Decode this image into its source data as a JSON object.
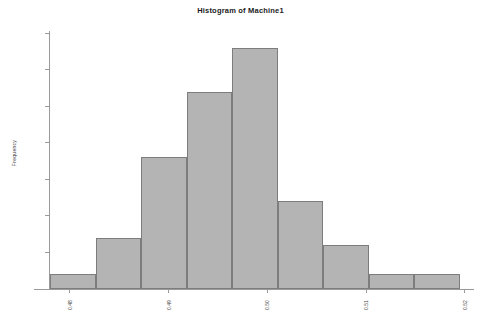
{
  "chart_data": {
    "type": "bar",
    "title": "Histogram of Machine1",
    "xlabel": "",
    "ylabel": "Frequency",
    "categories": [
      "0.4805",
      "0.4850",
      "0.4895",
      "0.4940",
      "0.4985",
      "0.5030",
      "0.5075",
      "0.5120",
      "0.5165"
    ],
    "values": [
      2,
      7,
      18,
      27,
      33,
      12,
      6,
      2,
      2
    ],
    "bar_order": [
      2,
      7,
      18,
      27,
      33,
      12,
      6,
      2
    ],
    "bars": [
      {
        "label": "bin-1",
        "value": 2
      },
      {
        "label": "bin-2",
        "value": 7
      },
      {
        "label": "bin-3",
        "value": 18
      },
      {
        "label": "bin-4",
        "value": 27
      },
      {
        "label": "bin-5",
        "value": 33
      },
      {
        "label": "bin-6",
        "value": 12
      },
      {
        "label": "bin-7",
        "value": 6
      },
      {
        "label": "bin-8",
        "value": 2
      }
    ],
    "ylim": [
      0,
      35
    ],
    "ytick_values": [
      0,
      5,
      10,
      15,
      20,
      25,
      30,
      35
    ],
    "ytick_labels": [
      "0",
      "5",
      "10",
      "15",
      "20",
      "25",
      "30",
      "35"
    ],
    "xlim": [
      0.478,
      0.5195
    ],
    "xtick_labels": [
      "0.48",
      "0.49",
      "0.50",
      "0.51",
      "0.52"
    ],
    "grid": false,
    "legend": null,
    "bar_fill": "#b4b4b4",
    "bar_edge": "#7d7d7d",
    "axis_color": "#9a9a9a",
    "background": "#ffffff"
  }
}
